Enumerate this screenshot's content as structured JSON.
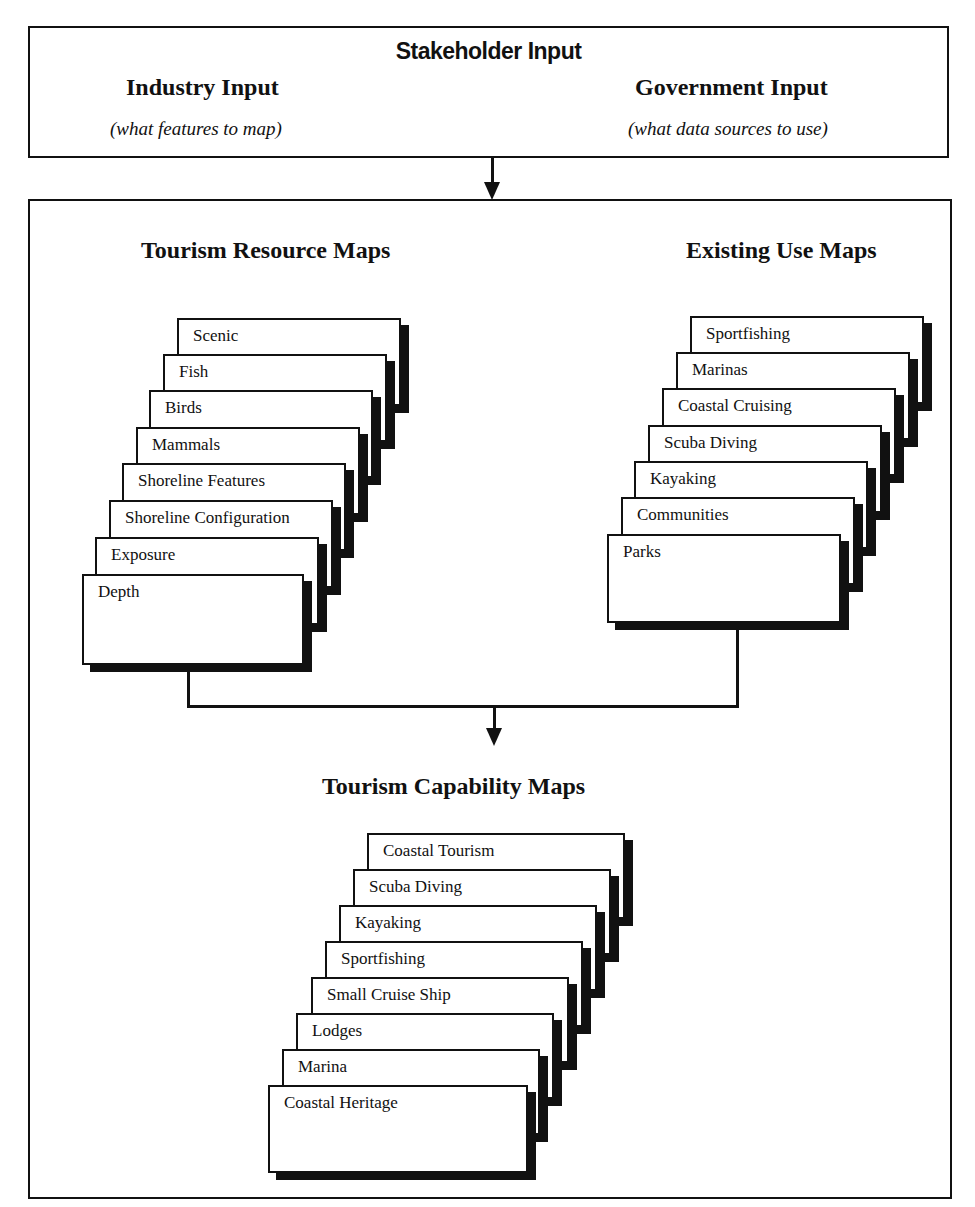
{
  "stakeholder": {
    "title": "Stakeholder Input",
    "industry": {
      "heading": "Industry Input",
      "subtitle": "(what features to map)"
    },
    "government": {
      "heading": "Government Input",
      "subtitle": "(what data sources to use)"
    }
  },
  "resource_maps": {
    "heading": "Tourism Resource Maps",
    "layers": [
      "Scenic",
      "Fish",
      "Birds",
      "Mammals",
      "Shoreline Features",
      "Shoreline Configuration",
      "Exposure",
      "Depth"
    ]
  },
  "existing_use_maps": {
    "heading": "Existing Use Maps",
    "layers": [
      "Sportfishing",
      "Marinas",
      "Coastal Cruising",
      "Scuba Diving",
      "Kayaking",
      "Communities",
      "Parks"
    ]
  },
  "capability_maps": {
    "heading": "Tourism Capability Maps",
    "layers": [
      "Coastal Tourism",
      "Scuba Diving",
      "Kayaking",
      "Sportfishing",
      "Small Cruise Ship",
      "Lodges",
      "Marina",
      "Coastal Heritage"
    ]
  },
  "colors": {
    "ink": "#111111",
    "paper": "#ffffff"
  }
}
